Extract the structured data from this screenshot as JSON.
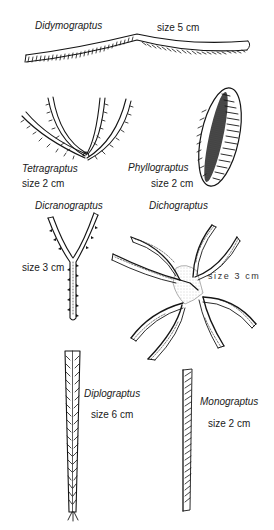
{
  "figure": {
    "specimens": [
      {
        "genus": "Didymograptus",
        "size": "size 5 cm"
      },
      {
        "genus": "Tetragraptus",
        "size": "size 2 cm"
      },
      {
        "genus": "Phyllograptus",
        "size": "size 2 cm"
      },
      {
        "genus": "Dicranograptus",
        "size": "size 3 cm"
      },
      {
        "genus": "Dichograptus",
        "size": "size  3  cm"
      },
      {
        "genus": "Diplograptus",
        "size": "size 6 cm"
      },
      {
        "genus": "Monograptus",
        "size": "size 2 cm"
      }
    ]
  },
  "colors": {
    "background": "#ffffff",
    "ink": "#151515",
    "stipple": "#9a9a9a"
  }
}
